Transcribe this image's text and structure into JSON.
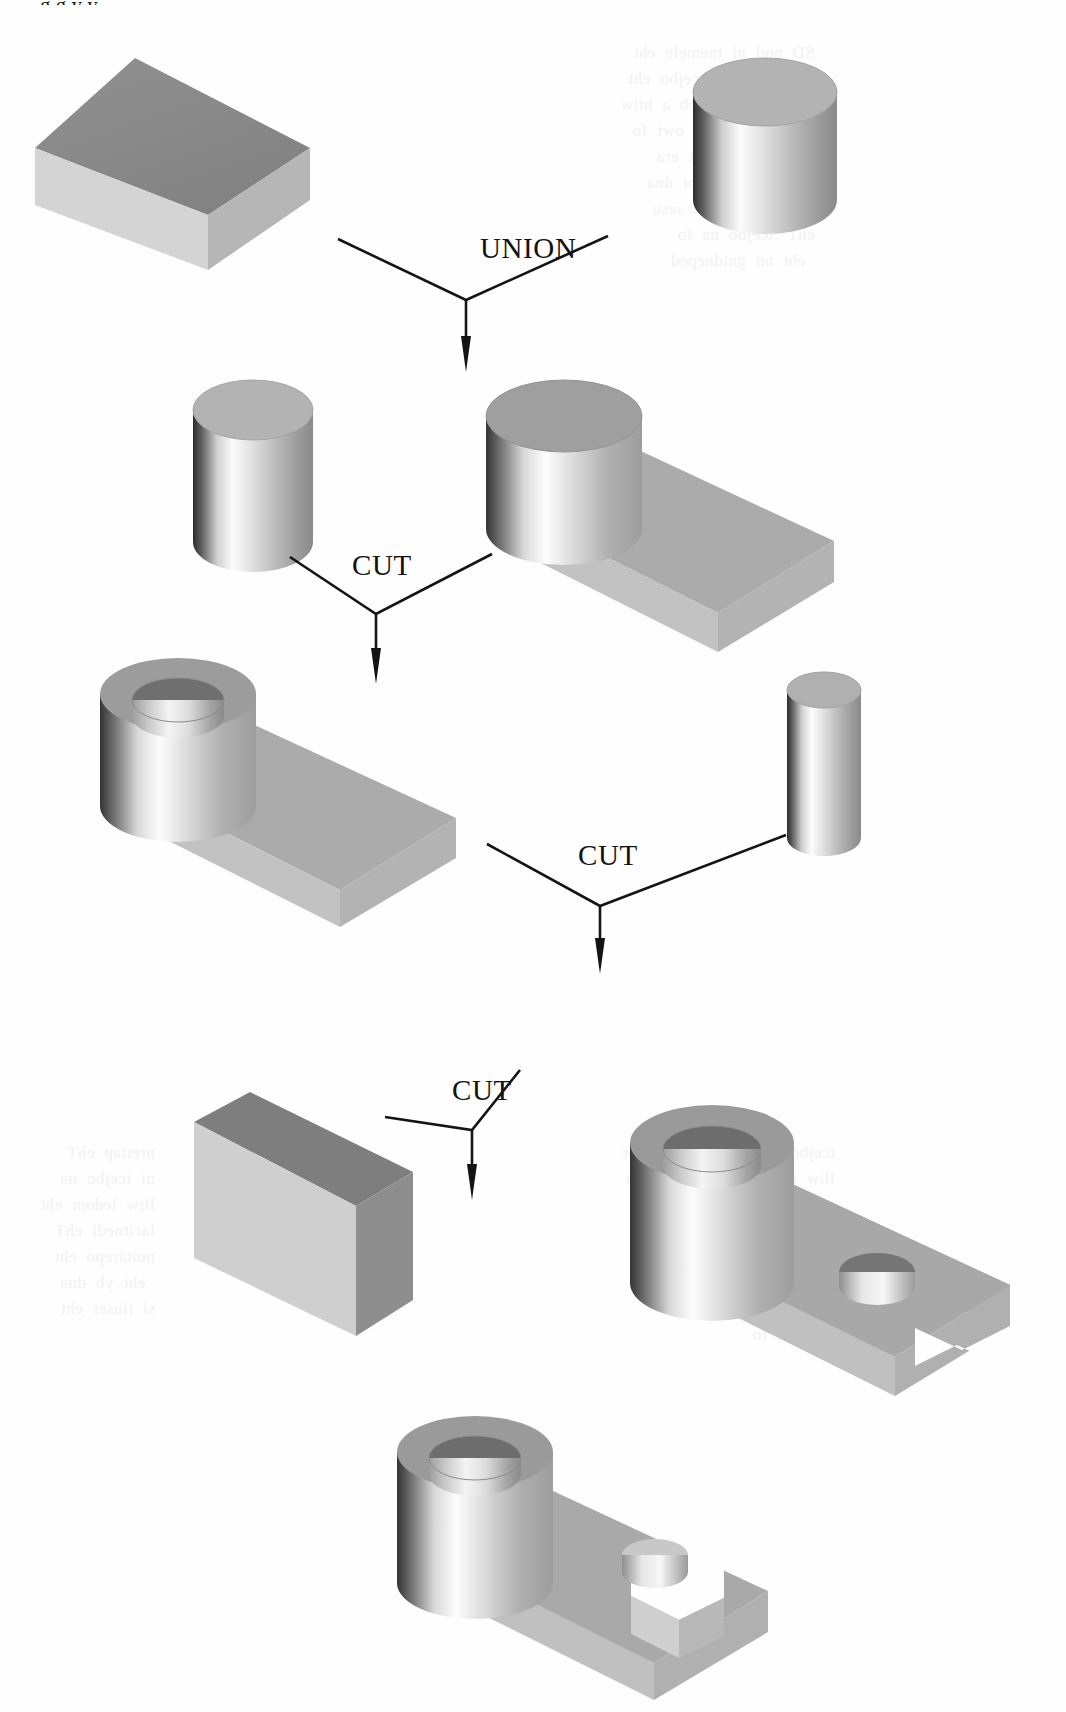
{
  "figure": {
    "background_color": "#fefefe",
    "ink_color": "#121212",
    "cropped_heading_text": "g g y y"
  },
  "operations": [
    {
      "id": "op-union",
      "label": "UNION",
      "x": 480,
      "y": 258,
      "apex_x": 466,
      "apex_y": 300
    },
    {
      "id": "op-cut-1",
      "label": "CUT",
      "x": 352,
      "y": 575,
      "apex_x": 376,
      "apex_y": 614
    },
    {
      "id": "op-cut-2",
      "label": "CUT",
      "x": 578,
      "y": 865,
      "apex_x": 600,
      "apex_y": 906
    },
    {
      "id": "op-cut-3",
      "label": "CUT",
      "x": 452,
      "y": 1100,
      "apex_x": 472,
      "apex_y": 1140
    }
  ],
  "shapes": [
    {
      "id": "block-1",
      "name": "rectangular-block-primitive",
      "row": 1,
      "side": "left"
    },
    {
      "id": "cylinder-1",
      "name": "large-cylinder-primitive",
      "row": 1,
      "side": "right"
    },
    {
      "id": "cylinder-2",
      "name": "cutting-cylinder-primitive",
      "row": 2,
      "side": "left"
    },
    {
      "id": "union-1",
      "name": "cylinder-on-block-union-result",
      "row": 2,
      "side": "right"
    },
    {
      "id": "tube-block",
      "name": "tube-on-block-cut-result",
      "row": 3,
      "side": "left"
    },
    {
      "id": "cylinder-3",
      "name": "small-cutting-cylinder-primitive",
      "row": 3,
      "side": "right"
    },
    {
      "id": "slab-1",
      "name": "slab-cutting-block-primitive",
      "row": 4,
      "side": "left"
    },
    {
      "id": "tube-hole",
      "name": "tube-block-with-hole-cut-result",
      "row": 4,
      "side": "right"
    },
    {
      "id": "final-part",
      "name": "final-machined-part",
      "row": 5,
      "side": "center"
    }
  ],
  "palette": {
    "face_top_dark": "#8d8d8d",
    "face_top_mid": "#a9a9a9",
    "face_front_light": "#d2d2d2",
    "face_side_mid": "#b5b5b5",
    "face_shadow": "#6e6e6e",
    "highlight": "#fbfbfb",
    "edge": "#6a6a6a"
  },
  "bleed_through": {
    "note": "faint mirrored text showing through from the reverse side of the scanned page",
    "blocks": [
      {
        "x": 620,
        "y": 40,
        "text": "SD  nod  ni  tnemele  eht\nsa  denifed  si  tcejbo  eht\nnoitarepo  naeloob  a  htiw\nehT  .seirtemoeg  owt  fo\nstnemeriuqer  eht  era\n  ,pihsnoitaler  eht  dna\nnoitcurtsnoc  eht  sesu\nehT  .tcejbo  na  fo\n  eht  no  gnidneped"
      },
      {
        "x": 620,
        "y": 1140,
        "text": "tcejbo  eht  rof  noitarugifnoc\nlliw  sihT  .pets  txen  eht  ni\neht  no  desab  tluser  eht\nedulcni  eht  ,eroferehT  .s\nowt  eht  fo  noitcennoc\nerofeb  lliw  eht  ,yllaniF\nlacirdnilyc  eht  gnittuc\ndna  eht  fo"
      },
      {
        "x": 40,
        "y": 1140,
        "text": "nrettap  ehT\nni  tcejbo  na\nlliw  ledom  eht\nlacitnedi  ehT\nnoitarepo  eht\n  eht  yb  dna\nsi  tluser  eht"
      }
    ]
  }
}
